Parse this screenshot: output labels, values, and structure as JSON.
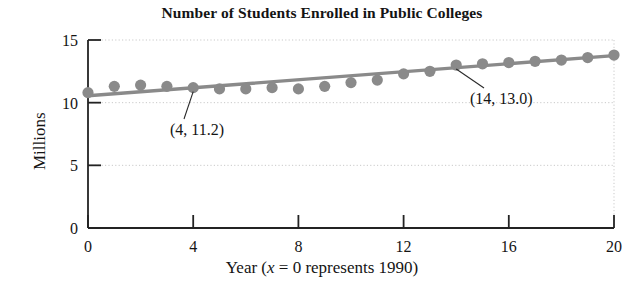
{
  "chart_data": {
    "type": "scatter",
    "title": "Number of Students Enrolled in Public Colleges",
    "xlabel_parts": {
      "pre": "Year (",
      "var": "x",
      "post": " = 0 represents 1990)"
    },
    "xlabel": "Year (x = 0 represents 1990)",
    "ylabel": "Millions",
    "xlim": [
      0,
      20
    ],
    "ylim": [
      0,
      15
    ],
    "xticks": [
      0,
      4,
      8,
      12,
      16,
      20
    ],
    "yticks": [
      0,
      5,
      10,
      15
    ],
    "xtick_labels": [
      "0",
      "4",
      "8",
      "12",
      "16",
      "20"
    ],
    "ytick_labels": [
      "0",
      "5",
      "10",
      "15"
    ],
    "grid": "dotted horizontal gridlines at 5, 10, 15; dotted vertical line at x=20",
    "legend": "none",
    "x": [
      0,
      1,
      2,
      3,
      4,
      5,
      6,
      7,
      8,
      9,
      10,
      11,
      12,
      13,
      14,
      15,
      16,
      17,
      18,
      19,
      20
    ],
    "values": [
      10.8,
      11.3,
      11.4,
      11.3,
      11.2,
      11.1,
      11.1,
      11.2,
      11.1,
      11.3,
      11.6,
      11.8,
      12.3,
      12.5,
      13.0,
      13.1,
      13.2,
      13.3,
      13.4,
      13.6,
      13.8
    ],
    "series": [
      {
        "name": "Students enrolled (millions)",
        "marker": "filled-circle",
        "color": "#8a8a8a",
        "values": [
          10.8,
          11.3,
          11.4,
          11.3,
          11.2,
          11.1,
          11.1,
          11.2,
          11.1,
          11.3,
          11.6,
          11.8,
          12.3,
          12.5,
          13.0,
          13.1,
          13.2,
          13.3,
          13.4,
          13.6,
          13.8
        ]
      },
      {
        "name": "trend line",
        "type": "line",
        "color": "#8a8a8a",
        "endpoints": [
          [
            0,
            10.55
          ],
          [
            20,
            13.75
          ]
        ]
      }
    ],
    "annotations": [
      {
        "label": "(4, 11.2)",
        "point_x": 4,
        "point_y": 11.2,
        "text_x": 170,
        "text_y": 135
      },
      {
        "label": "(14, 13.0)",
        "point_x": 14,
        "point_y": 13.0,
        "text_x": 470,
        "text_y": 104
      }
    ]
  }
}
